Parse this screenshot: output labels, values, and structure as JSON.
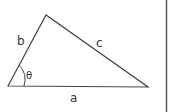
{
  "diagram": {
    "type": "triangle",
    "vertices": {
      "bottom_left": [
        8,
        86
      ],
      "apex": [
        46,
        15
      ],
      "bottom_right": [
        148,
        87
      ]
    },
    "sides": {
      "a": "a",
      "b": "b",
      "c": "c"
    },
    "angle": {
      "label": "θ",
      "at": "bottom_left",
      "between": [
        "a",
        "b"
      ]
    },
    "stroke_color": "#444444",
    "border_color": "#555555"
  }
}
